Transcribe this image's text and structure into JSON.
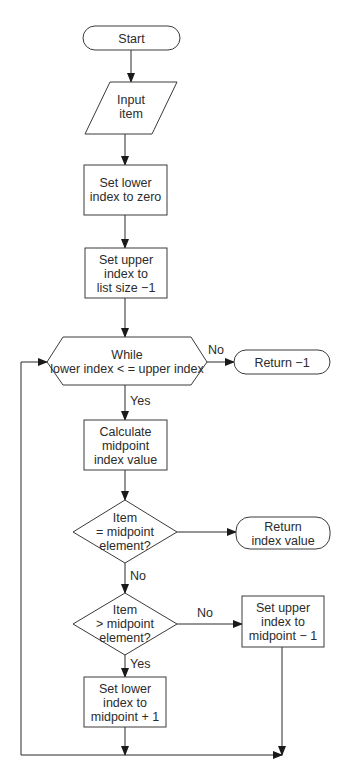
{
  "diagram": {
    "type": "flowchart",
    "nodes": {
      "start": {
        "kind": "terminator",
        "lines": [
          "Start"
        ]
      },
      "input": {
        "kind": "input-output",
        "lines": [
          "Input",
          "item"
        ]
      },
      "set_lower_zero": {
        "kind": "process",
        "lines": [
          "Set lower",
          "index to zero"
        ]
      },
      "set_upper_size": {
        "kind": "process",
        "lines": [
          "Set upper",
          "index to",
          "list size −1"
        ]
      },
      "while": {
        "kind": "loop-condition",
        "lines": [
          "While",
          "lower index < = upper index"
        ]
      },
      "return_neg": {
        "kind": "terminator",
        "lines": [
          "Return −1"
        ]
      },
      "calc_mid": {
        "kind": "process",
        "lines": [
          "Calculate",
          "midpoint",
          "index value"
        ]
      },
      "eq_check": {
        "kind": "decision",
        "lines": [
          "Item",
          "= midpoint",
          "element?"
        ]
      },
      "return_index": {
        "kind": "terminator",
        "lines": [
          "Return",
          "index value"
        ]
      },
      "gt_check": {
        "kind": "decision",
        "lines": [
          "Item",
          "> midpoint",
          "element?"
        ]
      },
      "set_upper_mid": {
        "kind": "process",
        "lines": [
          "Set upper",
          "index to",
          "midpoint − 1"
        ]
      },
      "set_lower_mid": {
        "kind": "process",
        "lines": [
          "Set lower",
          "index to",
          "midpoint + 1"
        ]
      }
    },
    "edges": [
      {
        "from": "start",
        "to": "input",
        "label": ""
      },
      {
        "from": "input",
        "to": "set_lower_zero",
        "label": ""
      },
      {
        "from": "set_lower_zero",
        "to": "set_upper_size",
        "label": ""
      },
      {
        "from": "set_upper_size",
        "to": "while",
        "label": ""
      },
      {
        "from": "while",
        "to": "return_neg",
        "label": "No"
      },
      {
        "from": "while",
        "to": "calc_mid",
        "label": "Yes"
      },
      {
        "from": "calc_mid",
        "to": "eq_check",
        "label": ""
      },
      {
        "from": "eq_check",
        "to": "return_index",
        "label": ""
      },
      {
        "from": "eq_check",
        "to": "gt_check",
        "label": "No"
      },
      {
        "from": "gt_check",
        "to": "set_upper_mid",
        "label": "No"
      },
      {
        "from": "gt_check",
        "to": "set_lower_mid",
        "label": "Yes"
      },
      {
        "from": "set_lower_mid",
        "to": "while",
        "label": ""
      },
      {
        "from": "set_upper_mid",
        "to": "while",
        "label": ""
      }
    ],
    "labels": {
      "while_no": "No",
      "while_yes": "Yes",
      "eq_no": "No",
      "gt_no": "No",
      "gt_yes": "Yes"
    }
  }
}
